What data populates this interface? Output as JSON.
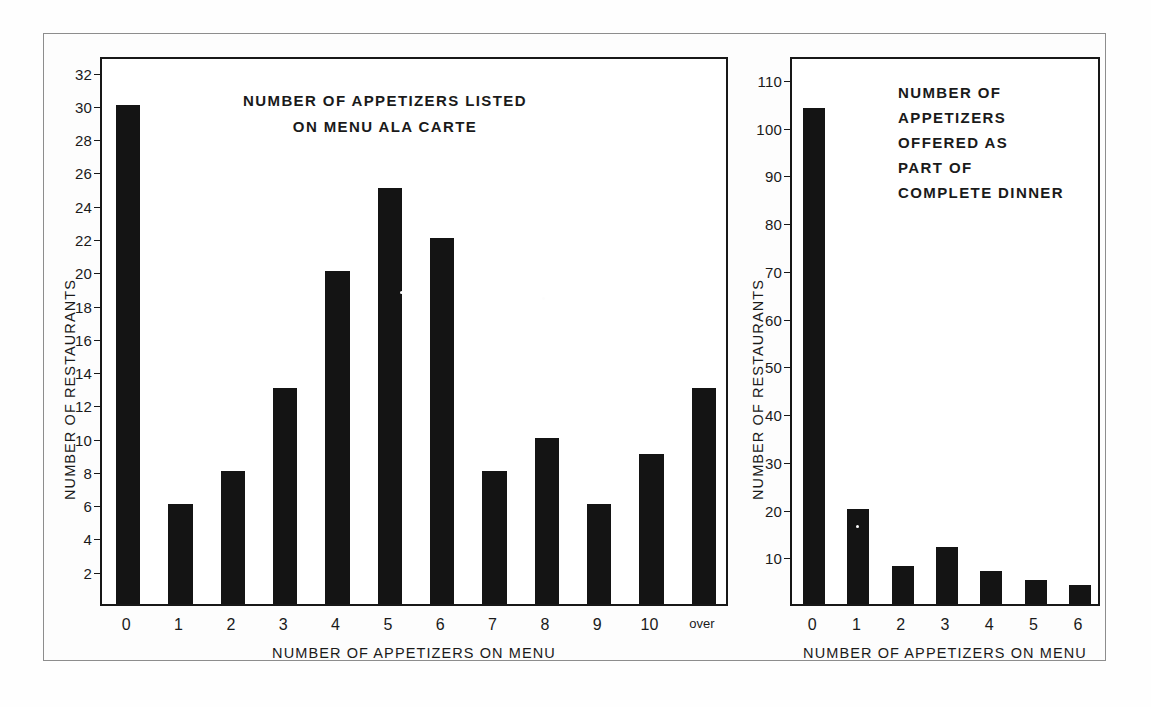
{
  "figure": {
    "background_color": "#fdfdfd",
    "ink_color": "#141414",
    "frame_color": "#8d8d8d"
  },
  "chart_data": [
    {
      "id": "a-la-carte",
      "type": "bar",
      "title": "NUMBER OF APPETIZERS LISTED\nON MENU ALA CARTE",
      "title_lines": [
        "NUMBER OF APPETIZERS LISTED",
        "ON MENU ALA CARTE"
      ],
      "xlabel": "NUMBER OF APPETIZERS ON MENU",
      "ylabel": "NUMBER OF RESTAURANTS",
      "categories": [
        "0",
        "1",
        "2",
        "3",
        "4",
        "5",
        "6",
        "7",
        "8",
        "9",
        "10",
        "over"
      ],
      "values": [
        30,
        6,
        8,
        13,
        20,
        25,
        22,
        8,
        10,
        6,
        9,
        13
      ],
      "ylim": [
        0,
        33
      ],
      "yticks": [
        2,
        4,
        6,
        8,
        10,
        12,
        14,
        16,
        18,
        20,
        22,
        24,
        26,
        28,
        30,
        32
      ],
      "ytick_labels": [
        "2",
        "4",
        "6",
        "8",
        "10",
        "12",
        "14",
        "16",
        "18",
        "20",
        "22",
        "24",
        "26",
        "28",
        "30",
        "32"
      ],
      "grid": false,
      "legend": "none"
    },
    {
      "id": "complete-dinner",
      "type": "bar",
      "title": "NUMBER OF\nAPPETIZERS\nOFFERED AS\nPART OF\nCOMPLETE DINNER",
      "title_lines": [
        "NUMBER OF",
        "APPETIZERS",
        "OFFERED AS",
        "PART OF",
        "COMPLETE DINNER"
      ],
      "xlabel": "NUMBER OF APPETIZERS ON MENU",
      "ylabel": "NUMBER OF RESTAURANTS",
      "categories": [
        "0",
        "1",
        "2",
        "3",
        "4",
        "5",
        "6"
      ],
      "values": [
        104,
        20,
        8,
        12,
        7,
        5,
        4
      ],
      "ylim": [
        0,
        115
      ],
      "yticks": [
        10,
        20,
        30,
        40,
        50,
        60,
        70,
        80,
        90,
        100,
        110
      ],
      "ytick_labels": [
        "10",
        "20",
        "30",
        "40",
        "50",
        "60",
        "70",
        "80",
        "90",
        "100",
        "110"
      ],
      "grid": false,
      "legend": "none"
    }
  ]
}
